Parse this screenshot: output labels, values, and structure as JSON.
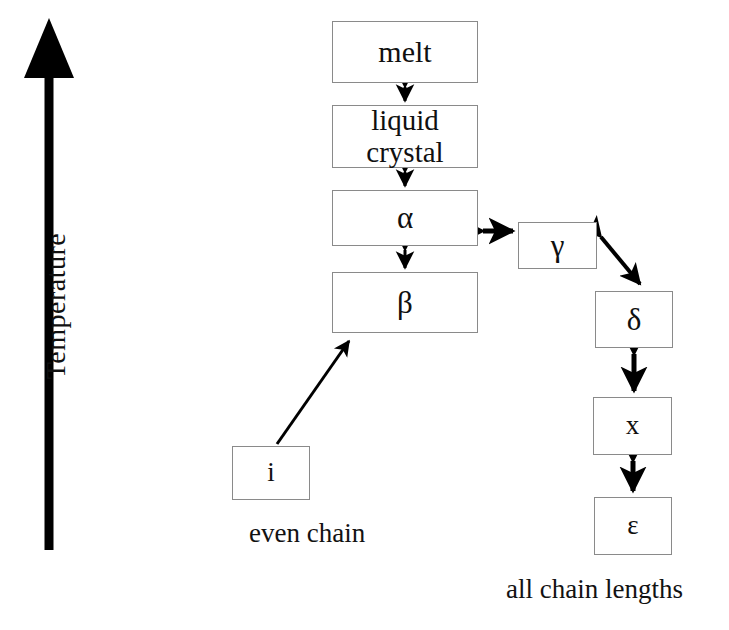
{
  "figure": {
    "type": "phase-transition-diagram",
    "background_color": "#ffffff",
    "ink_color": "#000000",
    "box_border_color": "#8a8a8a"
  },
  "axis": {
    "label": "Temperature",
    "orientation": "vertical",
    "direction": "increasing-upward",
    "arrowhead": "up"
  },
  "boxes": {
    "melt": "melt",
    "liquid_crystal": "liquid\ncrystal",
    "alpha": "α",
    "beta": "β",
    "gamma": "γ",
    "delta": "δ",
    "x": "x",
    "epsilon": "ε",
    "i": "i"
  },
  "captions": {
    "even_chain": "even chain",
    "all_chain_lengths": "all chain lengths"
  },
  "connections": [
    {
      "name": "melt-liquid-crystal",
      "from": "melt",
      "to": "liquid_crystal",
      "style": "double-headed",
      "direction": "vertical"
    },
    {
      "name": "liquid-crystal-alpha",
      "from": "liquid_crystal",
      "to": "alpha",
      "style": "double-headed",
      "direction": "vertical"
    },
    {
      "name": "alpha-beta",
      "from": "alpha",
      "to": "beta",
      "style": "double-headed",
      "direction": "vertical"
    },
    {
      "name": "alpha-gamma",
      "from": "alpha",
      "to": "gamma",
      "style": "double-headed",
      "direction": "horizontal"
    },
    {
      "name": "gamma-delta",
      "from": "gamma",
      "to": "delta",
      "style": "double-headed",
      "direction": "diagonal"
    },
    {
      "name": "delta-x",
      "from": "delta",
      "to": "x",
      "style": "double-headed",
      "direction": "vertical"
    },
    {
      "name": "x-epsilon",
      "from": "x",
      "to": "epsilon",
      "style": "double-headed",
      "direction": "vertical"
    },
    {
      "name": "i-beta",
      "from": "i",
      "to": "beta",
      "style": "single-headed",
      "direction": "diagonal"
    }
  ]
}
